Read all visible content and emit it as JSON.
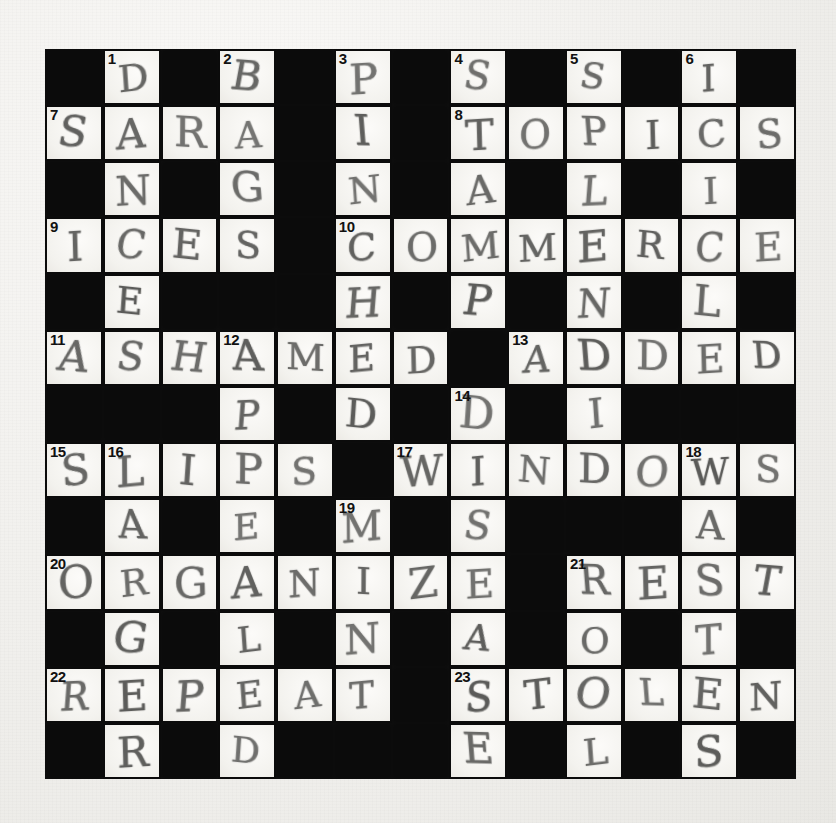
{
  "puzzle": {
    "kind": "crossword-grid",
    "title": "Handwritten crossword puzzle (completed)",
    "rows": 13,
    "cols": 13,
    "colors": {
      "paper": "#f2f1ef",
      "block": "#0b0b0b",
      "cell": "#f6f5f2",
      "pencil": "#5a5a58",
      "number": "#111111"
    },
    "grid": [
      [
        {
          "t": "block"
        },
        {
          "t": "open",
          "n": "1",
          "l": "D"
        },
        {
          "t": "block"
        },
        {
          "t": "open",
          "n": "2",
          "l": "B"
        },
        {
          "t": "block"
        },
        {
          "t": "open",
          "n": "3",
          "l": "P"
        },
        {
          "t": "block"
        },
        {
          "t": "open",
          "n": "4",
          "l": "S"
        },
        {
          "t": "block"
        },
        {
          "t": "open",
          "n": "5",
          "l": "S"
        },
        {
          "t": "block"
        },
        {
          "t": "open",
          "n": "6",
          "l": "I"
        },
        {
          "t": "block"
        }
      ],
      [
        {
          "t": "open",
          "n": "7",
          "l": "S"
        },
        {
          "t": "open",
          "l": "A"
        },
        {
          "t": "open",
          "l": "R"
        },
        {
          "t": "open",
          "l": "A"
        },
        {
          "t": "block"
        },
        {
          "t": "open",
          "l": "I"
        },
        {
          "t": "block"
        },
        {
          "t": "open",
          "n": "8",
          "l": "T"
        },
        {
          "t": "open",
          "l": "O"
        },
        {
          "t": "open",
          "l": "P"
        },
        {
          "t": "open",
          "l": "I"
        },
        {
          "t": "open",
          "l": "C"
        },
        {
          "t": "open",
          "l": "S"
        }
      ],
      [
        {
          "t": "block"
        },
        {
          "t": "open",
          "l": "N"
        },
        {
          "t": "block"
        },
        {
          "t": "open",
          "l": "G"
        },
        {
          "t": "block"
        },
        {
          "t": "open",
          "l": "N"
        },
        {
          "t": "block"
        },
        {
          "t": "open",
          "l": "A"
        },
        {
          "t": "block"
        },
        {
          "t": "open",
          "l": "L"
        },
        {
          "t": "block"
        },
        {
          "t": "open",
          "l": "I"
        },
        {
          "t": "block"
        }
      ],
      [
        {
          "t": "open",
          "n": "9",
          "l": "I"
        },
        {
          "t": "open",
          "l": "C"
        },
        {
          "t": "open",
          "l": "E"
        },
        {
          "t": "open",
          "l": "S"
        },
        {
          "t": "block"
        },
        {
          "t": "open",
          "n": "10",
          "l": "C"
        },
        {
          "t": "open",
          "l": "O"
        },
        {
          "t": "open",
          "l": "M"
        },
        {
          "t": "open",
          "l": "M"
        },
        {
          "t": "open",
          "l": "E"
        },
        {
          "t": "open",
          "l": "R"
        },
        {
          "t": "open",
          "l": "C"
        },
        {
          "t": "open",
          "l": "E"
        }
      ],
      [
        {
          "t": "block"
        },
        {
          "t": "open",
          "l": "E"
        },
        {
          "t": "block"
        },
        {
          "t": "block"
        },
        {
          "t": "block"
        },
        {
          "t": "open",
          "l": "H"
        },
        {
          "t": "block"
        },
        {
          "t": "open",
          "l": "P"
        },
        {
          "t": "block"
        },
        {
          "t": "open",
          "l": "N"
        },
        {
          "t": "block"
        },
        {
          "t": "open",
          "l": "L"
        },
        {
          "t": "block"
        }
      ],
      [
        {
          "t": "open",
          "n": "11",
          "l": "A"
        },
        {
          "t": "open",
          "l": "S"
        },
        {
          "t": "open",
          "l": "H"
        },
        {
          "t": "open",
          "n": "12",
          "l": "A"
        },
        {
          "t": "open",
          "l": "M"
        },
        {
          "t": "open",
          "l": "E"
        },
        {
          "t": "open",
          "l": "D"
        },
        {
          "t": "block"
        },
        {
          "t": "open",
          "n": "13",
          "l": "A"
        },
        {
          "t": "open",
          "l": "D"
        },
        {
          "t": "open",
          "l": "D"
        },
        {
          "t": "open",
          "l": "E"
        },
        {
          "t": "open",
          "l": "D"
        }
      ],
      [
        {
          "t": "block"
        },
        {
          "t": "block"
        },
        {
          "t": "block"
        },
        {
          "t": "open",
          "l": "P"
        },
        {
          "t": "block"
        },
        {
          "t": "open",
          "l": "D"
        },
        {
          "t": "block"
        },
        {
          "t": "open",
          "n": "14",
          "l": "D"
        },
        {
          "t": "block"
        },
        {
          "t": "open",
          "l": "I"
        },
        {
          "t": "block"
        },
        {
          "t": "block"
        },
        {
          "t": "block"
        }
      ],
      [
        {
          "t": "open",
          "n": "15",
          "l": "S"
        },
        {
          "t": "open",
          "n": "16",
          "l": "L"
        },
        {
          "t": "open",
          "l": "I"
        },
        {
          "t": "open",
          "l": "P"
        },
        {
          "t": "open",
          "l": "S"
        },
        {
          "t": "block"
        },
        {
          "t": "open",
          "n": "17",
          "l": "W"
        },
        {
          "t": "open",
          "l": "I"
        },
        {
          "t": "open",
          "l": "N"
        },
        {
          "t": "open",
          "l": "D"
        },
        {
          "t": "open",
          "l": "O"
        },
        {
          "t": "open",
          "n": "18",
          "l": "W"
        },
        {
          "t": "open",
          "l": "S"
        }
      ],
      [
        {
          "t": "block"
        },
        {
          "t": "open",
          "l": "A"
        },
        {
          "t": "block"
        },
        {
          "t": "open",
          "l": "E"
        },
        {
          "t": "block"
        },
        {
          "t": "open",
          "n": "19",
          "l": "M"
        },
        {
          "t": "block"
        },
        {
          "t": "open",
          "l": "S"
        },
        {
          "t": "block"
        },
        {
          "t": "block"
        },
        {
          "t": "block"
        },
        {
          "t": "open",
          "l": "A"
        },
        {
          "t": "block"
        }
      ],
      [
        {
          "t": "open",
          "n": "20",
          "l": "O"
        },
        {
          "t": "open",
          "l": "R"
        },
        {
          "t": "open",
          "l": "G"
        },
        {
          "t": "open",
          "l": "A"
        },
        {
          "t": "open",
          "l": "N"
        },
        {
          "t": "open",
          "l": "I"
        },
        {
          "t": "open",
          "l": "Z"
        },
        {
          "t": "open",
          "l": "E"
        },
        {
          "t": "block"
        },
        {
          "t": "open",
          "n": "21",
          "l": "R"
        },
        {
          "t": "open",
          "l": "E"
        },
        {
          "t": "open",
          "l": "S"
        },
        {
          "t": "open",
          "l": "T"
        }
      ],
      [
        {
          "t": "block"
        },
        {
          "t": "open",
          "l": "G"
        },
        {
          "t": "block"
        },
        {
          "t": "open",
          "l": "L"
        },
        {
          "t": "block"
        },
        {
          "t": "open",
          "l": "N"
        },
        {
          "t": "block"
        },
        {
          "t": "open",
          "l": "A"
        },
        {
          "t": "block"
        },
        {
          "t": "open",
          "l": "O"
        },
        {
          "t": "block"
        },
        {
          "t": "open",
          "l": "T"
        },
        {
          "t": "block"
        }
      ],
      [
        {
          "t": "open",
          "n": "22",
          "l": "R"
        },
        {
          "t": "open",
          "l": "E"
        },
        {
          "t": "open",
          "l": "P"
        },
        {
          "t": "open",
          "l": "E"
        },
        {
          "t": "open",
          "l": "A"
        },
        {
          "t": "open",
          "l": "T"
        },
        {
          "t": "block"
        },
        {
          "t": "open",
          "n": "23",
          "l": "S"
        },
        {
          "t": "open",
          "l": "T"
        },
        {
          "t": "open",
          "l": "O"
        },
        {
          "t": "open",
          "l": "L"
        },
        {
          "t": "open",
          "l": "E"
        },
        {
          "t": "open",
          "l": "N"
        }
      ],
      [
        {
          "t": "block"
        },
        {
          "t": "open",
          "l": "R"
        },
        {
          "t": "block"
        },
        {
          "t": "open",
          "l": "D"
        },
        {
          "t": "block"
        },
        {
          "t": "block"
        },
        {
          "t": "block"
        },
        {
          "t": "open",
          "l": "E"
        },
        {
          "t": "block"
        },
        {
          "t": "open",
          "l": "L"
        },
        {
          "t": "block"
        },
        {
          "t": "open",
          "l": "S"
        },
        {
          "t": "block"
        }
      ]
    ],
    "answers": {
      "across": [
        {
          "n": "7",
          "text": "SARA"
        },
        {
          "n": "8",
          "text": "TOPICS"
        },
        {
          "n": "9",
          "text": "ICES"
        },
        {
          "n": "10",
          "text": "COMMERCE"
        },
        {
          "n": "11",
          "text": "ASHAMED"
        },
        {
          "n": "13",
          "text": "ADDED"
        },
        {
          "n": "15",
          "text": "SLIPS"
        },
        {
          "n": "17",
          "text": "WINDOWS"
        },
        {
          "n": "20",
          "text": "ORGANIZE"
        },
        {
          "n": "21",
          "text": "REST"
        },
        {
          "n": "22",
          "text": "REPEAT"
        },
        {
          "n": "23",
          "text": "STOLEN"
        }
      ],
      "down": [
        {
          "n": "1",
          "text": "DANCE"
        },
        {
          "n": "2",
          "text": "BAG"
        },
        {
          "n": "3",
          "text": "PINCH"
        },
        {
          "n": "4",
          "text": "STAMP"
        },
        {
          "n": "5",
          "text": "SLENDER"
        },
        {
          "n": "6",
          "text": "SILL"
        },
        {
          "n": "11",
          "text": "A"
        },
        {
          "n": "12",
          "text": "AMPLE"
        },
        {
          "n": "13",
          "text": "ADDED"
        },
        {
          "n": "14",
          "text": "DISEASE"
        },
        {
          "n": "16",
          "text": "LAGGER"
        },
        {
          "n": "18",
          "text": "WATS"
        },
        {
          "n": "19",
          "text": "MINT"
        },
        {
          "n": "21",
          "text": "ROTTEN"
        }
      ]
    }
  }
}
